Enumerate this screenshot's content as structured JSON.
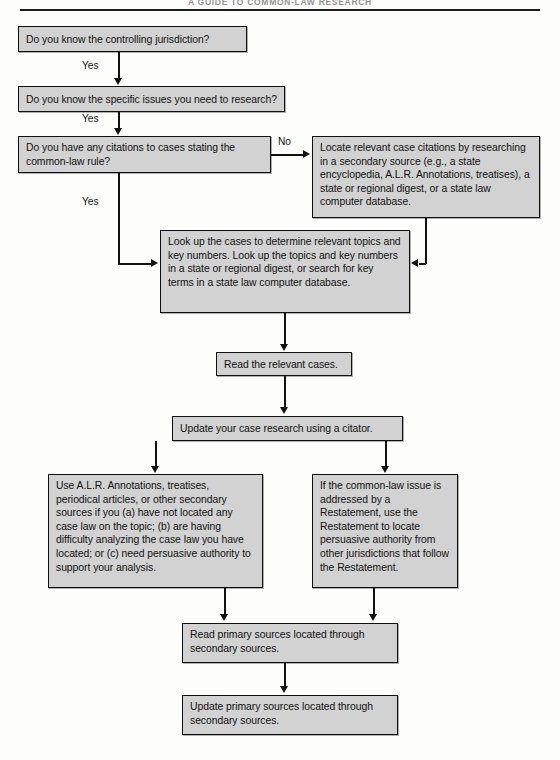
{
  "page": {
    "running_head": "A GUIDE TO COMMON-LAW RESEARCH",
    "width": 560,
    "height": 760,
    "box_fill_color": "#d2d2d2",
    "box_border_color": "#101010",
    "connector_color": "#121212"
  },
  "nodes": {
    "jurisdiction": "Do you know the controlling jurisdiction?",
    "specific_issues": "Do you know the specific issues you need to research?",
    "citations_question": "Do you have any citations to cases stating the common-law rule?",
    "locate_citations": "Locate relevant case citations by researching in a secondary source (e.g., a state encyclopedia, A.L.R. Annotations, treatises), a state or regional digest, or a state law computer database.",
    "look_up_cases": "Look up the cases to determine relevant topics and key numbers. Look up the topics and key numbers in a state or regional digest, or search for key terms in a state law computer database.",
    "read_cases": "Read the relevant cases.",
    "update_case_research": "Update your case research using a citator.",
    "secondary_sources": "Use A.L.R. Annotations, treatises, periodical articles, or other secondary sources if you (a) have not located any case law on the topic; (b) are having difficulty analyzing the case law you have located; or (c) need persuasive authority to support your analysis.",
    "restatement": "If the common-law issue is addressed by a Restatement, use the Restatement to locate persuasive authority from other jurisdictions that follow the Restatement.",
    "read_primary": "Read primary sources located through secondary sources.",
    "update_primary": "Update primary sources located through secondary sources."
  },
  "edge_labels": {
    "yes_1": "Yes",
    "yes_2": "Yes",
    "no_1": "No",
    "yes_3": "Yes"
  }
}
